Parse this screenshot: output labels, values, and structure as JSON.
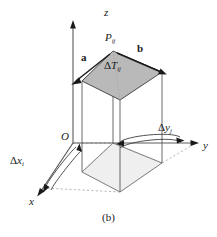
{
  "figure": {
    "caption": "(b)",
    "axes": {
      "z_label": "z",
      "y_label": "y",
      "x_label": "x",
      "origin_label": "O"
    },
    "labels": {
      "point": {
        "base": "P",
        "sub": "ij"
      },
      "vector_a": "a",
      "vector_b": "b",
      "patch_area": {
        "delta": "Δ",
        "base": "T",
        "sub": "ij"
      },
      "delta_y": {
        "delta": "Δ",
        "base": "y",
        "sub": "j"
      },
      "delta_x": {
        "delta": "Δ",
        "base": "x",
        "sub": "i"
      }
    },
    "colors": {
      "stroke": "#1a1a1a",
      "line": "#4d4d4d",
      "dashed": "#8c8c8c",
      "top_face_fill": "#b3b3b3",
      "base_face_fill": "#ededed",
      "background": "#ffffff"
    },
    "geometry": {
      "top_face": [
        [
          113,
          51
        ],
        [
          162,
          72
        ],
        [
          120,
          100
        ],
        [
          82,
          81
        ]
      ],
      "base_face": [
        [
          113,
          143
        ],
        [
          162,
          163
        ],
        [
          120,
          192
        ],
        [
          82,
          172
        ]
      ],
      "column_height_px": 92
    }
  }
}
